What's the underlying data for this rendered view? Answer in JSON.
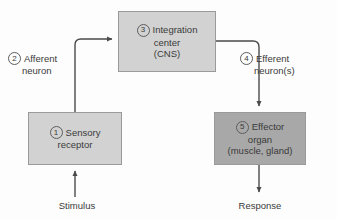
{
  "diagram": {
    "colors": {
      "background": "#fdfdfd",
      "box_light": "#d2d2d2",
      "box_dark": "#a8a8a8",
      "box_border": "#9a9a9a",
      "text": "#3a3a3a",
      "arrow": "#4a4a4a"
    },
    "boxes": [
      {
        "id": "integration-center",
        "number": "3",
        "lines": [
          "Integration",
          "center",
          "(CNS)"
        ],
        "shade": "light"
      },
      {
        "id": "sensory-receptor",
        "number": "1",
        "lines": [
          "Sensory",
          "receptor"
        ],
        "shade": "light"
      },
      {
        "id": "effector-organ",
        "number": "5",
        "lines": [
          "Effector",
          "organ",
          "(muscle, gland)"
        ],
        "shade": "dark"
      }
    ],
    "side_labels": [
      {
        "id": "afferent-neuron",
        "number": "2",
        "lines": [
          "Afferent",
          "neuron"
        ]
      },
      {
        "id": "efferent-neuron",
        "number": "4",
        "lines": [
          "Efferent",
          "neuron(s)"
        ]
      }
    ],
    "captions": {
      "stimulus": "Stimulus",
      "response": "Response"
    },
    "arrows": [
      {
        "id": "stimulus-to-receptor",
        "from": "Stimulus",
        "to": "Sensory receptor",
        "direction": "up"
      },
      {
        "id": "receptor-to-integration",
        "from": "Sensory receptor",
        "to": "Integration center",
        "direction": "up-then-right"
      },
      {
        "id": "integration-to-effector",
        "from": "Integration center",
        "to": "Effector organ",
        "direction": "right-then-down"
      },
      {
        "id": "effector-to-response",
        "from": "Effector organ",
        "to": "Response",
        "direction": "down"
      }
    ]
  }
}
